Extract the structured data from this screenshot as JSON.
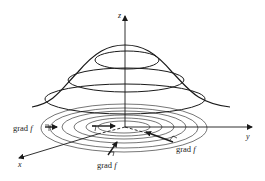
{
  "diagram": {
    "type": "surface-with-level-curves",
    "axes": {
      "x_label": "x",
      "y_label": "y",
      "z_label": "z"
    },
    "gradient_labels": [
      {
        "id": "left",
        "text": "grad",
        "fn": "f"
      },
      {
        "id": "bottom",
        "text": "grad",
        "fn": "f"
      },
      {
        "id": "right",
        "text": "grad",
        "fn": "f"
      }
    ],
    "colors": {
      "stroke": "#1a1a1a",
      "background": "#ffffff"
    }
  }
}
